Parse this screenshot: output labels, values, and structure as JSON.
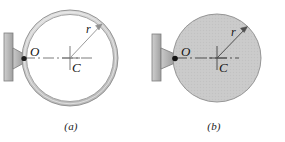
{
  "figure": {
    "background_color": "#ffffff",
    "panels": [
      {
        "id": "a",
        "caption": "(a)",
        "object_type": "ring",
        "labels": {
          "pivot": "O",
          "center": "C",
          "radius": "r"
        },
        "colors": {
          "ring_fill": "#d2d2d2",
          "ring_stroke": "#808080",
          "interior_fill": "#ffffff",
          "wall_fill": "#bdbdbd",
          "wall_stroke": "#7a7a7a",
          "bracket_fill": "#b5b5b5",
          "pivot_dot": "#1a1a1a",
          "centerline": "#6a6a6a",
          "radius_line": "#8a8a8a"
        },
        "geometry": {
          "center_x": 70,
          "center_y": 58,
          "outer_radius": 48,
          "inner_radius": 44,
          "pivot_x": 23,
          "pivot_y": 58
        }
      },
      {
        "id": "b",
        "caption": "(b)",
        "object_type": "disk",
        "labels": {
          "pivot": "O",
          "center": "C",
          "radius": "r"
        },
        "colors": {
          "disk_fill": "#c9c9c9",
          "disk_stroke": "#8c8c8c",
          "wall_fill": "#bdbdbd",
          "wall_stroke": "#7a7a7a",
          "bracket_fill": "#b5b5b5",
          "pivot_dot": "#1a1a1a",
          "centerline": "#5a5a5a",
          "radius_line": "#5a5a5a"
        },
        "geometry": {
          "center_x": 74,
          "center_y": 58,
          "outer_radius": 44,
          "pivot_x": 32,
          "pivot_y": 58
        }
      }
    ]
  }
}
